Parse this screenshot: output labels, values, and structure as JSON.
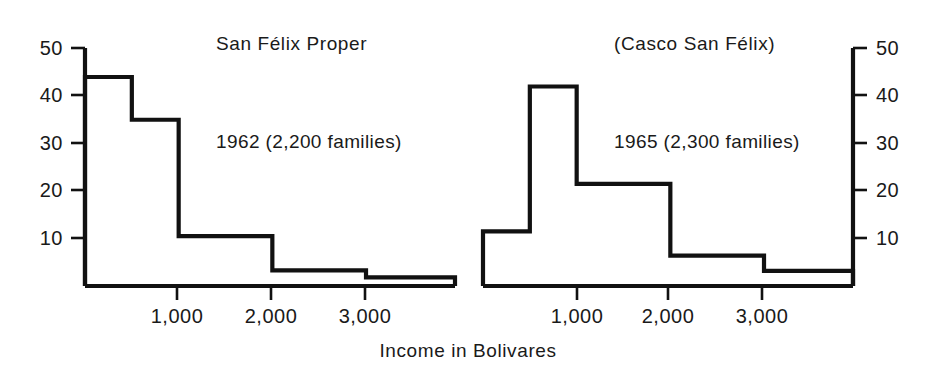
{
  "figure": {
    "x_axis_title": "Income in Bolivares",
    "background_color": "#ffffff",
    "ink_color": "#111111"
  },
  "left_panel": {
    "title": "San Félix Proper",
    "annotation": "1962 (2,200 families)",
    "y_ticks": [
      "50",
      "40",
      "30",
      "20",
      "10"
    ],
    "x_ticks": [
      "1,000",
      "2,000",
      "3,000"
    ]
  },
  "right_panel": {
    "title": "(Casco San Félix)",
    "annotation": "1965 (2,300 families)",
    "y_ticks": [
      "50",
      "40",
      "30",
      "20",
      "10"
    ],
    "x_ticks": [
      "1,000",
      "2,000",
      "3,000"
    ]
  },
  "chart_data": {
    "type": "bar",
    "xlabel": "Income in Bolivares",
    "ylabel": "Percent of families",
    "subtype": "step-histogram",
    "xlim": [
      0,
      3950
    ],
    "ylim": [
      0,
      50
    ],
    "grid": false,
    "legend": "none",
    "y_tick_values": [
      10,
      20,
      30,
      40,
      50
    ],
    "x_tick_values": [
      1000,
      2000,
      3000
    ],
    "bin_edges": [
      0,
      500,
      1000,
      2000,
      3000,
      3950
    ],
    "bin_labels": [
      "0–500",
      "500–1,000",
      "1,000–2,000",
      "2,000–3,000",
      "3,000+"
    ],
    "panels": [
      {
        "name": "San Félix Proper",
        "title": "San Félix Proper",
        "annotation": "1962 (2,200 families)",
        "year": 1962,
        "families": 2200,
        "values": [
          44,
          35,
          10.5,
          3.3,
          1.8
        ]
      },
      {
        "name": "(Casco San Félix)",
        "title": "(Casco San Félix)",
        "annotation": "1965 (2,300 families)",
        "year": 1965,
        "families": 2300,
        "values": [
          11.5,
          42,
          21.5,
          6.4,
          3.2
        ]
      }
    ]
  }
}
